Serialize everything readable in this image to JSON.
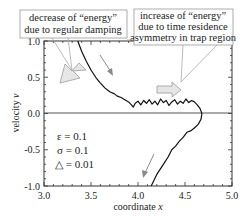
{
  "chart_data": {
    "type": "line",
    "title": "",
    "xlabel": "coordinate x",
    "ylabel": "velocity v",
    "xlim": [
      3.0,
      5.0
    ],
    "ylim": [
      -1.0,
      1.0
    ],
    "x_ticks": [
      "3.0",
      "3.5",
      "4.0",
      "4.5",
      "5.0"
    ],
    "y_ticks": [
      "1.0",
      "0.5",
      "0.0",
      "-0.5",
      "-1.0"
    ],
    "grid": false,
    "zero_line": true,
    "series": [
      {
        "name": "phase trajectory",
        "x": [
          3.36,
          3.4,
          3.45,
          3.5,
          3.55,
          3.6,
          3.65,
          3.7,
          3.75,
          3.78,
          3.82,
          3.86,
          3.9,
          3.93,
          3.95,
          3.97,
          4.0,
          4.03,
          4.06,
          4.09,
          4.12,
          4.15,
          4.18,
          4.21,
          4.24,
          4.27,
          4.3,
          4.33,
          4.36,
          4.39,
          4.42,
          4.45,
          4.48,
          4.51,
          4.54,
          4.57,
          4.6,
          4.63,
          4.66,
          4.68,
          4.67,
          4.64,
          4.6,
          4.56,
          4.52,
          4.48,
          4.44,
          4.4,
          4.36,
          4.32,
          4.28,
          4.24,
          4.2,
          4.17,
          4.14
        ],
        "y": [
          1.0,
          0.86,
          0.72,
          0.6,
          0.5,
          0.42,
          0.35,
          0.3,
          0.27,
          0.24,
          0.22,
          0.19,
          0.16,
          0.12,
          0.09,
          0.14,
          0.17,
          0.12,
          0.18,
          0.14,
          0.19,
          0.13,
          0.17,
          0.12,
          0.2,
          0.15,
          0.18,
          0.11,
          0.16,
          0.19,
          0.13,
          0.17,
          0.14,
          0.2,
          0.15,
          0.18,
          0.16,
          0.12,
          0.07,
          0.0,
          -0.08,
          -0.15,
          -0.2,
          -0.24,
          -0.26,
          -0.33,
          -0.38,
          -0.45,
          -0.5,
          -0.6,
          -0.68,
          -0.76,
          -0.84,
          -0.92,
          -1.0
        ],
        "color": "#111111"
      }
    ],
    "annotations": [
      {
        "text": "decrease of “energy” due to regular damping",
        "lines": [
          "decrease of “energy”",
          "due to regular damping"
        ]
      },
      {
        "text": "increase of “energy” due to time residence asymmetry in trap region",
        "lines": [
          "increase of “energy”",
          "due to time residence",
          "asymmetry in trap region"
        ]
      }
    ],
    "legend": [
      "ε = 0.1",
      "σ = 0.1",
      "△ = 0.01"
    ]
  },
  "labels": {
    "xlabel_text": "coordinate ",
    "xlabel_var": "x",
    "ylabel_text": "velocity ",
    "ylabel_var": "v"
  },
  "colors": {
    "curve": "#111111",
    "axis": "#333333",
    "zero_line": "#555555",
    "arrow_fill": "#e6e6e6",
    "arrow_stroke": "#9a9a9a",
    "box_stroke": "#9a9a9a"
  }
}
